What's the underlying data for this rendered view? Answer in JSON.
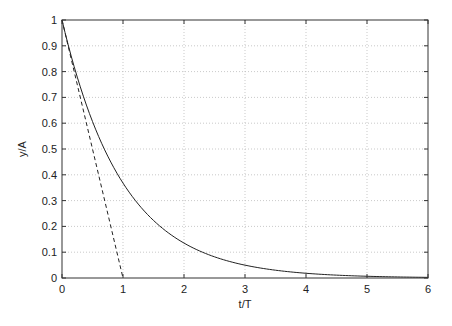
{
  "chart_data": {
    "type": "line",
    "title": "",
    "xlabel": "t/T",
    "ylabel": "y/A",
    "xlim": [
      0,
      6
    ],
    "ylim": [
      0,
      1
    ],
    "grid": true,
    "legend": null,
    "x_ticks": [
      "0",
      "1",
      "2",
      "3",
      "4",
      "5",
      "6"
    ],
    "y_ticks": [
      "0",
      "0.1",
      "0.2",
      "0.3",
      "0.4",
      "0.5",
      "0.6",
      "0.7",
      "0.8",
      "0.9",
      "1"
    ],
    "series": [
      {
        "name": "exponential decay y/A = exp(-t/T)",
        "style": "solid",
        "color": "#222222",
        "x": [
          0,
          0.25,
          0.5,
          0.75,
          1,
          1.5,
          2,
          2.5,
          3,
          3.5,
          4,
          4.5,
          5,
          5.5,
          6
        ],
        "y": [
          1,
          0.779,
          0.607,
          0.472,
          0.368,
          0.223,
          0.135,
          0.082,
          0.05,
          0.03,
          0.018,
          0.011,
          0.007,
          0.004,
          0.002
        ]
      },
      {
        "name": "initial tangent y/A = 1 - t/T",
        "style": "dashed",
        "color": "#222222",
        "x": [
          0,
          1
        ],
        "y": [
          1,
          0
        ]
      }
    ]
  }
}
